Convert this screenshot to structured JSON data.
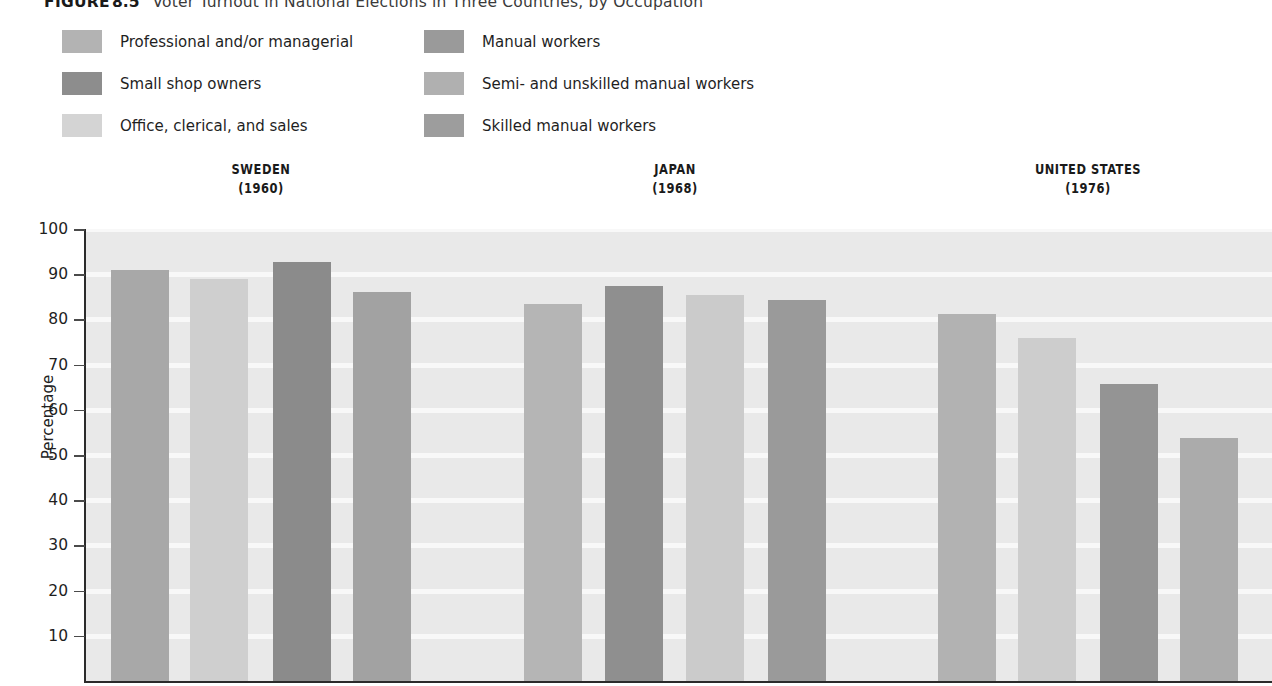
{
  "caption": {
    "figure_word": "FIGURE",
    "figure_number": "8.5",
    "title": "Voter Turnout in National Elections in Three Countries, by Occupation"
  },
  "legend": {
    "column1": [
      {
        "label": "Professional and/or managerial",
        "color": "#b3b3b3"
      },
      {
        "label": "Small shop owners",
        "color": "#8d8d8d"
      },
      {
        "label": "Office, clerical, and sales",
        "color": "#d4d4d4"
      }
    ],
    "column2": [
      {
        "label": "Manual workers",
        "color": "#9a9a9a"
      },
      {
        "label": "Semi- and unskilled manual workers",
        "color": "#b0b0b0"
      },
      {
        "label": "Skilled manual workers",
        "color": "#9d9d9d"
      }
    ]
  },
  "axis": {
    "ylabel": "Percentage",
    "yticks": [
      "100",
      "90",
      "80",
      "70",
      "60",
      "50",
      "40",
      "30",
      "20",
      "10"
    ],
    "ymin": 0,
    "ymax": 100
  },
  "chart_data": {
    "type": "bar",
    "title": "Voter Turnout in National Elections in Three Countries, by Occupation",
    "xlabel": "",
    "ylabel": "Percentage",
    "ylim": [
      0,
      100
    ],
    "grid": true,
    "legend_position": "top",
    "groups": [
      {
        "country": "SWEDEN",
        "year": "(1960)",
        "bars": [
          {
            "category": "Professional and/or managerial",
            "value": 91.0,
            "color": "#a8a8a8"
          },
          {
            "category": "Office, clerical, and sales",
            "value": 89.0,
            "color": "#cfcfcf"
          },
          {
            "category": "Small shop owners",
            "value": 92.7,
            "color": "#8b8b8b"
          },
          {
            "category": "Manual workers",
            "value": 86.0,
            "color": "#a2a2a2"
          }
        ]
      },
      {
        "country": "JAPAN",
        "year": "(1968)",
        "bars": [
          {
            "category": "Professional and/or managerial",
            "value": 83.5,
            "color": "#b5b5b5"
          },
          {
            "category": "Small shop owners",
            "value": 87.3,
            "color": "#8f8f8f"
          },
          {
            "category": "Office, clerical, and sales",
            "value": 85.3,
            "color": "#cbcbcb"
          },
          {
            "category": "Manual workers",
            "value": 84.2,
            "color": "#9a9a9a"
          }
        ]
      },
      {
        "country": "UNITED STATES",
        "year": "(1976)",
        "bars": [
          {
            "category": "Professional and/or managerial",
            "value": 81.2,
            "color": "#b2b2b2"
          },
          {
            "category": "Office, clerical, and sales",
            "value": 75.8,
            "color": "#cdcdcd"
          },
          {
            "category": "Skilled manual workers",
            "value": 65.8,
            "color": "#949494"
          },
          {
            "category": "Semi- and unskilled manual workers",
            "value": 53.7,
            "color": "#ababab"
          }
        ]
      }
    ]
  },
  "layout": {
    "group_centers_px": [
      261,
      675,
      1088
    ],
    "bar_x_px": [
      111,
      190,
      273,
      353,
      524,
      605,
      686,
      768,
      938,
      1018,
      1100,
      1180
    ],
    "bar_width_px": 58,
    "panel_left_px": 86,
    "panel_bottom_px": 459,
    "panel_top_px": 7,
    "px_per_percent": 4.52
  }
}
